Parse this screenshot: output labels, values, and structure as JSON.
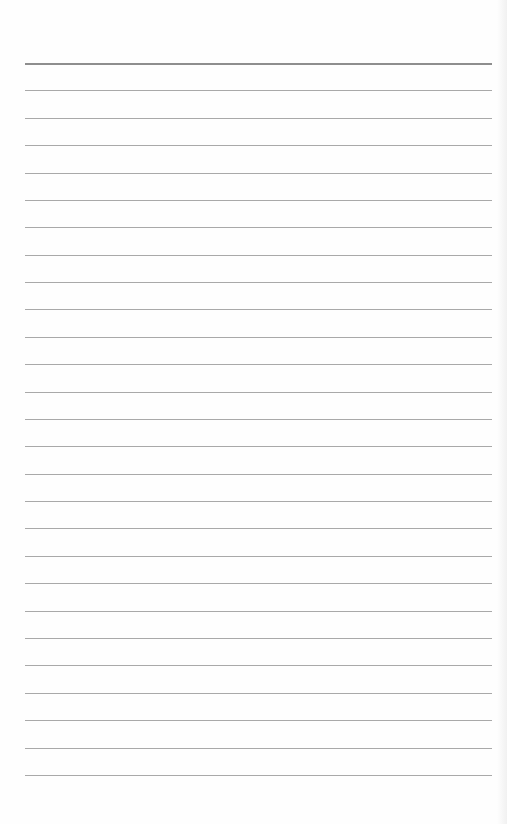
{
  "page": {
    "type": "lined-notebook-page",
    "background": "#fefefe",
    "line_color": "#a9a9a9",
    "top_line_color": "#8e8e8e",
    "line_count": 27,
    "first_line_y": 63,
    "line_spacing": 27.38,
    "line_left": 25,
    "line_right": 492
  }
}
